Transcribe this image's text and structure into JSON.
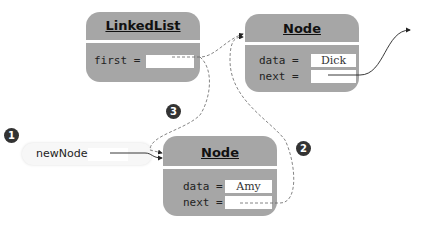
{
  "linked_list": {
    "title": "LinkedList",
    "fields": [
      {
        "label": "first =",
        "value": ""
      }
    ]
  },
  "node_dick": {
    "title": "Node",
    "fields": [
      {
        "label": "data =",
        "value": "Dick"
      },
      {
        "label": "next =",
        "value": ""
      }
    ]
  },
  "node_amy": {
    "title": "Node",
    "fields": [
      {
        "label": "data =",
        "value": "Amy"
      },
      {
        "label": "next =",
        "value": ""
      }
    ]
  },
  "new_node": {
    "label": "newNode =",
    "value": ""
  },
  "steps": [
    "1",
    "2",
    "3"
  ],
  "colors": {
    "box": "#a6a6a6",
    "badge": "#333333",
    "field": "#ffffff"
  }
}
